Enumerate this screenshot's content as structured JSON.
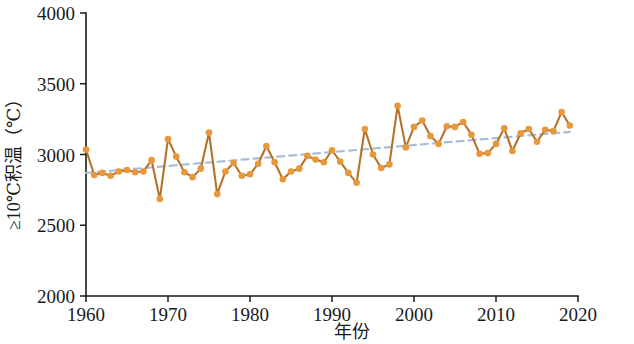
{
  "chart_data": {
    "type": "line",
    "title": "",
    "subtitle": "",
    "xlabel": "年份",
    "ylabel": "≥10℃积温（℃）",
    "xlim": [
      1960,
      2020
    ],
    "ylim": [
      2000,
      4000
    ],
    "xticks": [
      1960,
      1970,
      1980,
      1990,
      2000,
      2010,
      2020
    ],
    "xtick_labels": [
      "1960",
      "1970",
      "1980",
      "1990",
      "2000",
      "2010",
      "2020"
    ],
    "yticks": [
      2000,
      2500,
      3000,
      3500,
      4000
    ],
    "ytick_labels": [
      "2000",
      "2500",
      "3000",
      "3500",
      "4000"
    ],
    "grid": false,
    "legend": null,
    "annotations": [],
    "series": [
      {
        "name": "≥10℃积温",
        "style": "line-with-markers",
        "color": "#B5732A",
        "marker_color": "#E8973A",
        "x": [
          1960,
          1961,
          1962,
          1963,
          1964,
          1965,
          1966,
          1967,
          1968,
          1969,
          1970,
          1971,
          1972,
          1973,
          1974,
          1975,
          1976,
          1977,
          1978,
          1979,
          1980,
          1981,
          1982,
          1983,
          1984,
          1985,
          1986,
          1987,
          1988,
          1989,
          1990,
          1991,
          1992,
          1993,
          1994,
          1995,
          1996,
          1997,
          1998,
          1999,
          2000,
          2001,
          2002,
          2003,
          2004,
          2005,
          2006,
          2007,
          2008,
          2009,
          2010,
          2011,
          2012,
          2013,
          2014,
          2015,
          2016,
          2017,
          2018,
          2019
        ],
        "values": [
          3035,
          2855,
          2870,
          2850,
          2880,
          2890,
          2875,
          2880,
          2960,
          2685,
          3110,
          2985,
          2875,
          2840,
          2900,
          3155,
          2720,
          2880,
          2940,
          2850,
          2860,
          2935,
          3060,
          2945,
          2825,
          2880,
          2900,
          2990,
          2965,
          2945,
          3030,
          2950,
          2870,
          2800,
          3180,
          3000,
          2905,
          2930,
          3345,
          3050,
          3195,
          3240,
          3130,
          3075,
          3200,
          3195,
          3230,
          3140,
          3005,
          3010,
          3075,
          3185,
          3025,
          3150,
          3180,
          3090,
          3175,
          3165,
          3300,
          3205
        ]
      },
      {
        "name": "线性趋势线",
        "style": "dashed-trend",
        "color": "#A8BED6",
        "x": [
          1960,
          2019
        ],
        "values": [
          2870,
          3160
        ]
      }
    ]
  }
}
